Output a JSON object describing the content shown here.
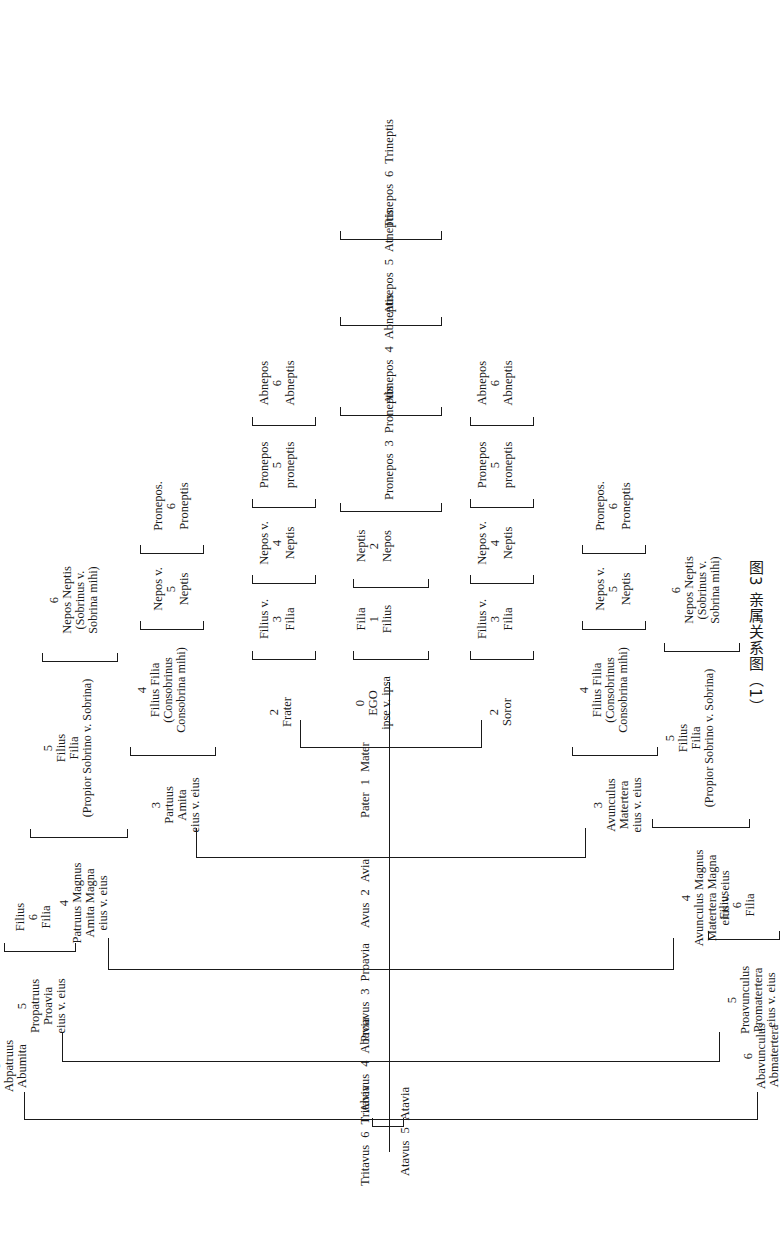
{
  "figure": {
    "caption": "图3  亲属关系图（1）",
    "caption_number": "图3",
    "caption_title": "亲属关系图（1）",
    "language": "Latin",
    "orientation": "rotated-90",
    "ink_color": "#1a1a1a",
    "paper_color": "#ffffff"
  },
  "ancestors": [
    {
      "degree": "6",
      "male": "Tritavus",
      "female": "Tritavia"
    },
    {
      "degree": "5",
      "male": "Atavus",
      "female": "Atavia"
    },
    {
      "degree": "4",
      "male": "Abavus",
      "female": "Abavia"
    },
    {
      "degree": "3",
      "male": "Proavus",
      "female": "Proavia"
    },
    {
      "degree": "2",
      "male": "Avus",
      "female": "Avia"
    },
    {
      "degree": "1",
      "male": "Pater",
      "female": "Mater"
    }
  ],
  "ego": {
    "degree": "0",
    "name": "EGO",
    "qualifier": "ipse v. ipsa"
  },
  "descendants": [
    {
      "degree": "1",
      "male": "Filius",
      "female": "Filia"
    },
    {
      "degree": "2",
      "male": "Nepos",
      "female": "Neptis"
    },
    {
      "degree": "3",
      "male": "Pronepos",
      "female": "Proneptis"
    },
    {
      "degree": "4",
      "male": "Abnepos",
      "female": "Abneptis"
    },
    {
      "degree": "5",
      "male": "Atnepos",
      "female": "Atneptis"
    },
    {
      "degree": "6",
      "male": "Trinepos",
      "female": "Trineptis"
    }
  ],
  "frater_branch": {
    "root": {
      "degree": "2",
      "label": "Frater"
    },
    "line": [
      {
        "degree": "3",
        "l1": "Filius v.",
        "l2": "Filia"
      },
      {
        "degree": "4",
        "l1": "Nepos v.",
        "l2": "Neptis"
      },
      {
        "degree": "5",
        "l1": "Pronepos",
        "l2": "proneptis"
      },
      {
        "degree": "6",
        "l1": "Abnepos",
        "l2": "Abneptis"
      }
    ]
  },
  "soror_branch": {
    "root": {
      "degree": "2",
      "label": "Soror"
    },
    "line": [
      {
        "degree": "3",
        "l1": "Filius v.",
        "l2": "Filia"
      },
      {
        "degree": "4",
        "l1": "Nepos v.",
        "l2": "Neptis"
      },
      {
        "degree": "5",
        "l1": "Pronepos",
        "l2": "proneptis"
      },
      {
        "degree": "6",
        "l1": "Abnepos",
        "l2": "Abneptis"
      }
    ]
  },
  "patruus_branch": {
    "root": {
      "degree": "3",
      "l1": "Partuus",
      "l2": "Amita",
      "l3": "eius v. eius"
    },
    "line": [
      {
        "degree": "4",
        "l1": "Filius Filia",
        "l2": "(Consobrinus",
        "l3": "Consobrina mihi)"
      },
      {
        "degree": "5",
        "l1": "Nepos v.",
        "l2": "Neptis"
      },
      {
        "degree": "6",
        "l1": "Pronepos.",
        "l2": "Proneptis"
      }
    ]
  },
  "avunculus_branch": {
    "root": {
      "degree": "3",
      "l1": "Avunculus",
      "l2": "Matertera",
      "l3": "eius v. eius"
    },
    "line": [
      {
        "degree": "4",
        "l1": "Filius Filia",
        "l2": "(Consobrinus",
        "l3": "Consobrina mihi)"
      },
      {
        "degree": "5",
        "l1": "Nepos v.",
        "l2": "Neptis"
      },
      {
        "degree": "6",
        "l1": "Pronepos.",
        "l2": "Proneptis"
      }
    ]
  },
  "patruus_magnus_branch": {
    "root": {
      "degree": "4",
      "l1": "Patruus Magnus",
      "l2": "Amita Magna",
      "l3": "eius v. eius"
    },
    "line": [
      {
        "degree": "5",
        "l1": "Filius",
        "l2": "Filia",
        "l3": "(Propior Sobrino v. Sobrina)"
      },
      {
        "degree": "6",
        "l1": "Nepos Neptis",
        "l2": "(Sobrinus v.",
        "l3": "Sobrina mihi)"
      }
    ]
  },
  "avunculus_magnus_branch": {
    "root": {
      "degree": "4",
      "l1": "Avunculus Magnus",
      "l2": "Matertera Magna",
      "l3": "eius v. eius"
    },
    "line": [
      {
        "degree": "5",
        "l1": "Filius",
        "l2": "Filia",
        "l3": "(Propior Sobrino v. Sobrina)"
      },
      {
        "degree": "6",
        "l1": "Nepos Neptis",
        "l2": "(Sobrinus v.",
        "l3": "Sobrina mihi)"
      }
    ]
  },
  "propatruus_branch": {
    "root": {
      "degree": "5",
      "l1": "Propatruus",
      "l2": "Proavia",
      "l3": "eius v. eius"
    },
    "line": [
      {
        "degree": "6",
        "l1": "Filius",
        "l2": "Filia"
      }
    ]
  },
  "proavunculus_branch": {
    "root": {
      "degree": "5",
      "l1": "Proavunculus",
      "l2": "Promatertera",
      "l3": "eius v. eius"
    },
    "line": [
      {
        "degree": "6",
        "l1": "Filius",
        "l2": "Filia"
      }
    ]
  },
  "abpatruus": {
    "degree": "6",
    "l1": "Abpatruus",
    "l2": "Abumita"
  },
  "abavunculus": {
    "degree": "6",
    "l1": "Abavunculus",
    "l2": "Abmatertera"
  }
}
